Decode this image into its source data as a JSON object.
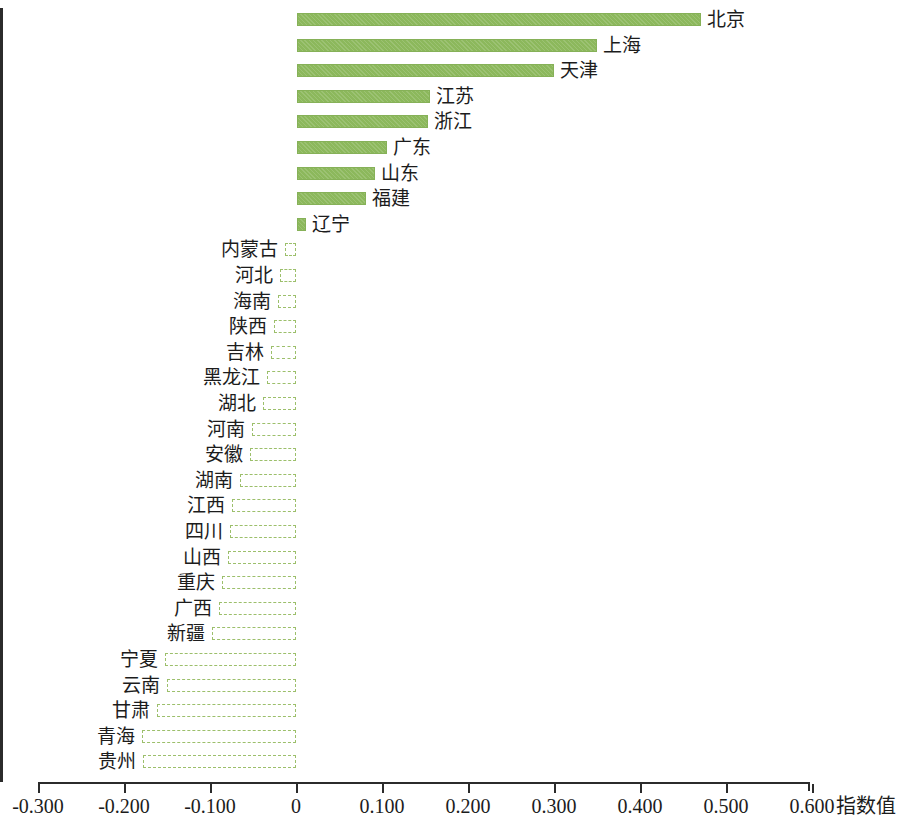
{
  "chart_data": {
    "type": "bar",
    "orientation": "horizontal",
    "title": "",
    "subtitle": "",
    "xlabel": "指数值",
    "ylabel": "",
    "xlim": [
      -0.3,
      0.6
    ],
    "xticks": [
      -0.3,
      -0.2,
      -0.1,
      0,
      0.1,
      0.2,
      0.3,
      0.4,
      0.5,
      0.6
    ],
    "xtick_labels": [
      "-0.300",
      "-0.200",
      "-0.100",
      "0",
      "0.100",
      "0.200",
      "0.300",
      "0.400",
      "0.500",
      "0.600"
    ],
    "grid": false,
    "legend": false,
    "legend_position": "none",
    "positive_color": "#8cb85c",
    "negative_color": "#ffffff",
    "negative_border_color": "#9cbf6b",
    "axis_color": "#2b2b2b",
    "categories": [
      "北京",
      "上海",
      "天津",
      "江苏",
      "浙江",
      "广东",
      "山东",
      "福建",
      "辽宁",
      "内蒙古",
      "河北",
      "海南",
      "陕西",
      "吉林",
      "黑龙江",
      "湖北",
      "河南",
      "安徽",
      "湖南",
      "江西",
      "四川",
      "山西",
      "重庆",
      "广西",
      "新疆",
      "宁夏",
      "云南",
      "甘肃",
      "青海",
      "贵州"
    ],
    "values": [
      0.47,
      0.349,
      0.299,
      0.155,
      0.152,
      0.105,
      0.091,
      0.08,
      0.01,
      -0.013,
      -0.019,
      -0.021,
      -0.026,
      -0.029,
      -0.034,
      -0.038,
      -0.051,
      -0.054,
      -0.065,
      -0.074,
      -0.077,
      -0.079,
      -0.086,
      -0.089,
      -0.098,
      -0.152,
      -0.15,
      -0.162,
      -0.179,
      -0.178
    ]
  },
  "axis": {
    "title": "指数值"
  }
}
